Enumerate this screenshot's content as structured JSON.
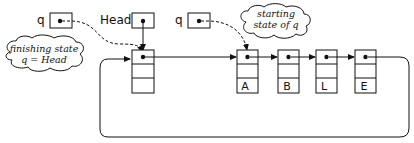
{
  "diagram": {
    "pointers": {
      "q_left": {
        "label": "q"
      },
      "head": {
        "label": "Head"
      },
      "q_right": {
        "label": "q"
      }
    },
    "clouds": {
      "finishing": {
        "line1": "finishing state",
        "line2": "q = Head"
      },
      "starting": {
        "line1": "starting",
        "line2": "state of q"
      }
    },
    "nodes": [
      {
        "id": "header",
        "value": ""
      },
      {
        "id": "A",
        "value": "A"
      },
      {
        "id": "B",
        "value": "B"
      },
      {
        "id": "L",
        "value": "L"
      },
      {
        "id": "E",
        "value": "E"
      }
    ],
    "colors": {
      "ink": "#111111",
      "background": "#ffffff"
    }
  }
}
